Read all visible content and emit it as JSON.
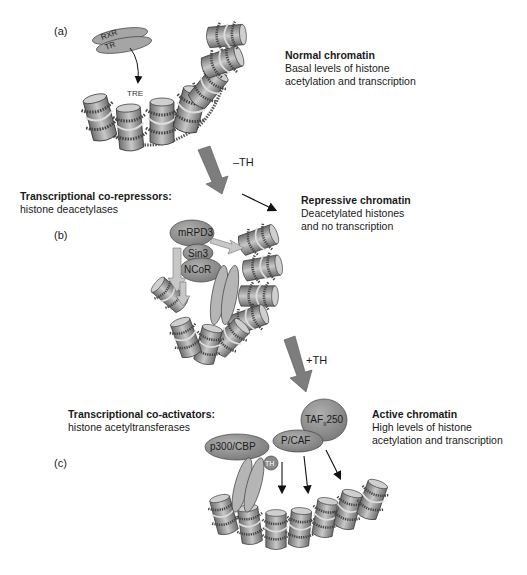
{
  "panels": {
    "a": {
      "label": "(a)",
      "title": "Normal chromatin",
      "line1": "Basal levels of histone",
      "line2": "acetylation and transcription",
      "proteins": [
        "RXR",
        "TR"
      ],
      "element": "TRE"
    },
    "transition1": {
      "label": "–TH"
    },
    "b": {
      "label": "(b)",
      "corepressor_title": "Transcriptional co-repressors:",
      "corepressor_sub": "histone deacetylases",
      "title": "Repressive chromatin",
      "line1": "Deacetylated histones",
      "line2": "and no transcription",
      "proteins": [
        "mRPD3",
        "Sin3",
        "NCoR",
        "RXR",
        "TR"
      ]
    },
    "transition2": {
      "label": "+TH"
    },
    "c": {
      "label": "(c)",
      "coactivator_title": "Transcriptional co-activators:",
      "coactivator_sub": "histone acetyltransferases",
      "title": "Active chromatin",
      "line1": "High levels of histone",
      "line2": "acetylation and transcription",
      "proteins": [
        "TAF",
        "II",
        "250",
        "P/CAF",
        "p300/CBP",
        "RXR",
        "TR",
        "TH"
      ]
    }
  },
  "colors": {
    "protein_fill": "#8a8a8a",
    "light_protein": "#b8b8b8",
    "arrow_gray": "#7a7a7a",
    "nucleosome": "#9a9a9a",
    "dna": "#555555"
  }
}
